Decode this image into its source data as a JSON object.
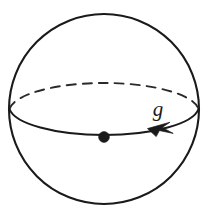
{
  "figure": {
    "kind": "geometric-diagram",
    "background_color": "#ffffff",
    "stroke_color": "#1a1a1a",
    "canvas": {
      "width": 209,
      "height": 218
    },
    "sphere": {
      "name": "sphere-outline",
      "center_x": 104,
      "center_y": 109,
      "radius": 95,
      "stroke_width": 2.1,
      "fill": "none"
    },
    "equator": {
      "name": "equator-ellipse",
      "center_x": 104,
      "center_y": 109,
      "radius_x": 95,
      "radius_y": 29,
      "front_arc_style": "solid",
      "back_arc_style": "dashed",
      "dash_pattern": "9 7",
      "stroke_width": 1.9,
      "orientation": "clockwise-viewed-from-above",
      "arrow_direction": "leftward"
    },
    "basepoint": {
      "name": "basepoint-dot",
      "x": 104,
      "y": 137,
      "radius": 5.4,
      "fill": "#1a1a1a"
    },
    "arrowhead": {
      "name": "direction-arrowhead",
      "tip_x": 148,
      "tip_y": 128,
      "points_toward": "left"
    },
    "label": {
      "name": "loop-label",
      "text": "g",
      "x": 158,
      "y": 116,
      "font_size": 21,
      "style": "italic-serif",
      "color": "#1a1a1a"
    }
  }
}
